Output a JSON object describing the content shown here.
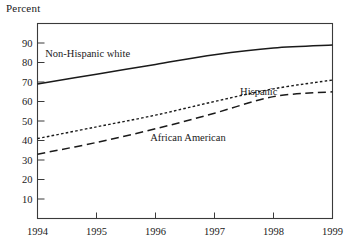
{
  "chart_data": {
    "type": "line",
    "title": "",
    "subtitle": "",
    "ylabel": "Percent",
    "xlabel": "",
    "x": [
      1994,
      1995,
      1996,
      1997,
      1998,
      1999
    ],
    "xlim": [
      1994,
      1999
    ],
    "ylim": [
      0,
      100
    ],
    "xtick_labels": [
      "1994",
      "1995",
      "1996",
      "1997",
      "1998",
      "1999"
    ],
    "ytick_labels": [
      "10",
      "20",
      "30",
      "40",
      "50",
      "60",
      "70",
      "80",
      "90"
    ],
    "yticks": [
      10,
      20,
      30,
      40,
      50,
      60,
      70,
      80,
      90
    ],
    "grid": false,
    "legend_position": "inline-annotations",
    "series": [
      {
        "name": "Non-Hispanic white",
        "style": "solid",
        "values": [
          69,
          74,
          79,
          84,
          87.5,
          89
        ],
        "label_x": 1994.85,
        "label_y": 83
      },
      {
        "name": "Hispanic",
        "style": "dotted",
        "values": [
          41,
          47,
          53,
          60,
          66.5,
          71
        ],
        "label_x": 1997.75,
        "label_y": 63.5
      },
      {
        "name": "African American",
        "style": "dashed",
        "values": [
          33,
          39,
          46,
          54,
          62.5,
          65
        ],
        "label_x": 1996.55,
        "label_y": 40
      }
    ],
    "annotations": [
      {
        "text": "Non-Hispanic white"
      },
      {
        "text": "Hispanic"
      },
      {
        "text": "African American"
      }
    ]
  },
  "colors": {
    "line": "#1a1a1a",
    "axis": "#3a3a3a",
    "background": "#ffffff"
  }
}
